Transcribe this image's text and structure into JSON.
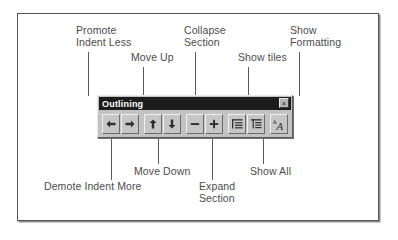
{
  "figure": {
    "type": "annotated-screenshot-diagram"
  },
  "toolbar": {
    "title": "Outlining",
    "close_label": "×",
    "close_icon": "close-icon",
    "buttons": [
      {
        "id": "promote",
        "icon": "arrow-left-icon",
        "tooltip": "Promote Indent Less"
      },
      {
        "id": "demote",
        "icon": "arrow-right-icon",
        "tooltip": "Demote Indent More"
      },
      {
        "id": "move-up",
        "icon": "arrow-up-icon",
        "tooltip": "Move Up"
      },
      {
        "id": "move-down",
        "icon": "arrow-down-icon",
        "tooltip": "Move Down"
      },
      {
        "id": "collapse",
        "icon": "minus-icon",
        "tooltip": "Collapse Section"
      },
      {
        "id": "expand",
        "icon": "plus-icon",
        "tooltip": "Expand Section"
      },
      {
        "id": "show-tiles",
        "icon": "show-tiles-icon",
        "tooltip": "Show tiles"
      },
      {
        "id": "show-all",
        "icon": "show-all-icon",
        "tooltip": "Show All"
      },
      {
        "id": "show-formatting",
        "icon": "show-formatting-icon",
        "tooltip": "Show Formatting"
      }
    ]
  },
  "callouts": {
    "promote": {
      "label": "Promote\nIndent Less"
    },
    "move_up": {
      "label": "Move Up"
    },
    "collapse": {
      "label": "Collapse\nSection"
    },
    "show_tiles": {
      "label": "Show tiles"
    },
    "show_formatting": {
      "label": "Show\nFormatting"
    },
    "demote": {
      "label": "Demote Indent More"
    },
    "move_down": {
      "label": "Move Down"
    },
    "expand": {
      "label": "Expand\nSection"
    },
    "show_all": {
      "label": "Show All"
    }
  },
  "colors": {
    "frame_border": "#555555",
    "titlebar_bg": "#1c1c1c",
    "titlebar_text": "#ffffff",
    "toolbar_face": "#c3c3c3",
    "label_text": "#4c4c4c",
    "leader_line": "#5a5a5a"
  }
}
